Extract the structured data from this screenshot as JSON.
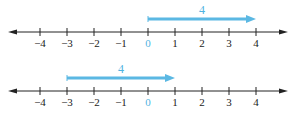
{
  "diagrams": [
    {
      "name": "number-line-top",
      "ticks": [
        "−4",
        "−3",
        "−2",
        "−1",
        "0",
        "1",
        "2",
        "3",
        "4"
      ],
      "vector": {
        "label": "4",
        "from": 0,
        "to": 4
      },
      "axis_y": 32,
      "vector_y": 19,
      "label_y": 14,
      "ticks_label_y": 47
    },
    {
      "name": "number-line-bottom",
      "ticks": [
        "−4",
        "−3",
        "−2",
        "−1",
        "0",
        "1",
        "2",
        "3",
        "4"
      ],
      "vector": {
        "label": "4",
        "from": -3,
        "to": 1
      },
      "axis_y": 91,
      "vector_y": 78,
      "label_y": 73,
      "ticks_label_y": 106
    }
  ],
  "colors": {
    "axis": "#222222",
    "vector": "#5bb8e3",
    "zero_label": "#4fb3df"
  },
  "scale": {
    "x0": 148,
    "unit": 27,
    "axis_left": 8,
    "axis_right": 288
  }
}
